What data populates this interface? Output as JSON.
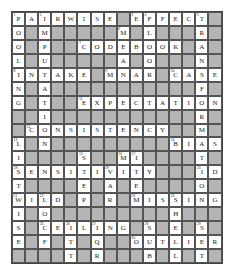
{
  "puzzle": {
    "type": "crossword",
    "rows": 18,
    "cols": 16,
    "colors": {
      "block": "#b5b5b5",
      "cell": "#ffffff",
      "border": "#555555"
    },
    "grid": [
      "PAIRWISE#EFFECT#",
      "O#M#####M#L###R#",
      "O#P##CODEBOOK#A#",
      "L#U#####A#O###N#",
      "INTAKE#MNAR#CASE",
      "N#A###########F#",
      "G#T##EXPECTATION",
      "##I###########R#",
      "#CONSISTENCY##M#",
      "L#N#########BIAS",
      "I####S##MI####T#",
      "SENSITIVITY###ID",
      "T####E#A#E####O#",
      "WILD#P#R#MISSING",
      "I#O#########H###",
      "S#CEILING#S#E#S#",
      "E#F#T#Q##OUTLIER",
      "####T#R###B#L#T#"
    ],
    "across": [
      "PAIRWISE",
      "EFFECT",
      "CODEBOOK",
      "INTAKE",
      "MNAR",
      "CASE",
      "EXPECTATION",
      "CONSISTENCY",
      "BIAS",
      "MI",
      "SENSITIVITY",
      "ID",
      "WILD",
      "MISSING",
      "CEILING",
      "OUTLIER"
    ],
    "down": [
      "POOLING",
      "IMPUTATION",
      "MEAN",
      "LOOR",
      "TRANSFORMATION",
      "LIST",
      "STEP",
      "VAR",
      "ITEM",
      "WISE",
      "LOCF",
      "ITT",
      "IQR",
      "SHELL",
      "SUB",
      "SET"
    ]
  }
}
